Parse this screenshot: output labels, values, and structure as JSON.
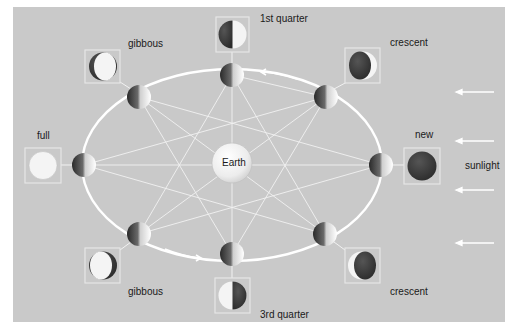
{
  "diagram": {
    "center_label": "Earth",
    "sunlight_label": "sunlight",
    "colors": {
      "background": "#c9c9c9",
      "orbit": "#ffffff",
      "sight_lines": "#f2f2f2",
      "moon_light": "#f4f4f4",
      "moon_dark": "#3a3a3a",
      "box_border": "#e6e6e6"
    },
    "phases": [
      {
        "id": "new",
        "label": "new"
      },
      {
        "id": "crescent-waxing",
        "label": "crescent"
      },
      {
        "id": "first-quarter",
        "label": "1st quarter"
      },
      {
        "id": "gibbous-waxing",
        "label": "gibbous"
      },
      {
        "id": "full",
        "label": "full"
      },
      {
        "id": "gibbous-waning",
        "label": "gibbous"
      },
      {
        "id": "third-quarter",
        "label": "3rd quarter"
      },
      {
        "id": "crescent-waning",
        "label": "crescent"
      }
    ],
    "sunlight_arrows": 4,
    "orbit_arrows": 2
  }
}
